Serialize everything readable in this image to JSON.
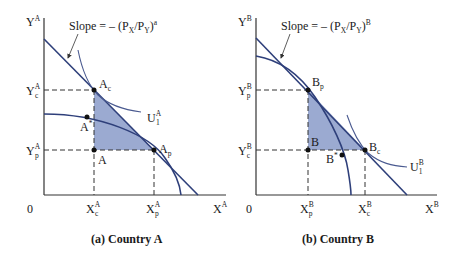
{
  "figure": {
    "panels": [
      {
        "id": "a",
        "caption": "(a)  Country A",
        "y_axis_label": "Y",
        "y_axis_sup": "A",
        "x_axis_label": "X",
        "x_axis_sup": "A",
        "origin_label": "0",
        "slope_label": "Slope = – (P",
        "slope_label_x": "X",
        "slope_label_mid": "/P",
        "slope_label_y": "Y",
        "slope_label_end": ")",
        "slope_label_sup": "a",
        "y_ticks": [
          {
            "main": "Y",
            "sup": "A",
            "sub": "c"
          },
          {
            "main": "Y",
            "sup": "A",
            "sub": "p"
          }
        ],
        "x_ticks": [
          {
            "main": "X",
            "sup": "A",
            "sub": "c"
          },
          {
            "main": "X",
            "sup": "A",
            "sub": "p"
          }
        ],
        "points": [
          {
            "main": "A",
            "sub": "c"
          },
          {
            "main": "A",
            "sub": "p"
          },
          {
            "main": "A",
            "sub": ""
          },
          {
            "main": "A",
            "sup": "*"
          }
        ],
        "indifference_curve": {
          "main": "U",
          "sup": "A",
          "sub": "1"
        }
      },
      {
        "id": "b",
        "caption": "(b)  Country B",
        "y_axis_label": "Y",
        "y_axis_sup": "B",
        "x_axis_label": "X",
        "x_axis_sup": "B",
        "origin_label": "0",
        "slope_label": "Slope = – (P",
        "slope_label_x": "X",
        "slope_label_mid": "/P",
        "slope_label_y": "Y",
        "slope_label_end": ")",
        "slope_label_sup": "B",
        "y_ticks": [
          {
            "main": "Y",
            "sup": "B",
            "sub": "p"
          },
          {
            "main": "Y",
            "sup": "B",
            "sub": "c"
          }
        ],
        "x_ticks": [
          {
            "main": "X",
            "sup": "B",
            "sub": "p"
          },
          {
            "main": "X",
            "sup": "B",
            "sub": "c"
          }
        ],
        "points": [
          {
            "main": "B",
            "sub": "p"
          },
          {
            "main": "B",
            "sub": "c"
          },
          {
            "main": "B",
            "sub": ""
          },
          {
            "main": "B",
            "sup": "*"
          }
        ],
        "indifference_curve": {
          "main": "U",
          "sup": "B",
          "sub": "1"
        }
      }
    ],
    "colors": {
      "curve": "#2e3f7a",
      "shade": "#8a9bc9",
      "axis": "#333333",
      "text": "#1a1a1a"
    }
  }
}
